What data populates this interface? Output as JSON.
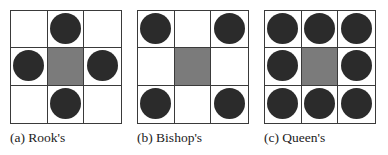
{
  "figure": {
    "colors": {
      "occupied": "#2b2b2b",
      "center": "#7b7b7b",
      "border": "#3a3a3a",
      "empty": "#ffffff"
    },
    "panels": [
      {
        "caption": "(a) Rook's",
        "cells": [
          [
            "empty",
            "dot",
            "empty"
          ],
          [
            "dot",
            "center",
            "dot"
          ],
          [
            "empty",
            "dot",
            "empty"
          ]
        ]
      },
      {
        "caption": "(b) Bishop's",
        "cells": [
          [
            "dot",
            "empty",
            "dot"
          ],
          [
            "empty",
            "center",
            "empty"
          ],
          [
            "dot",
            "empty",
            "dot"
          ]
        ]
      },
      {
        "caption": "(c) Queen's",
        "cells": [
          [
            "dot",
            "dot",
            "dot"
          ],
          [
            "dot",
            "center",
            "dot"
          ],
          [
            "dot",
            "dot",
            "dot"
          ]
        ]
      }
    ]
  }
}
